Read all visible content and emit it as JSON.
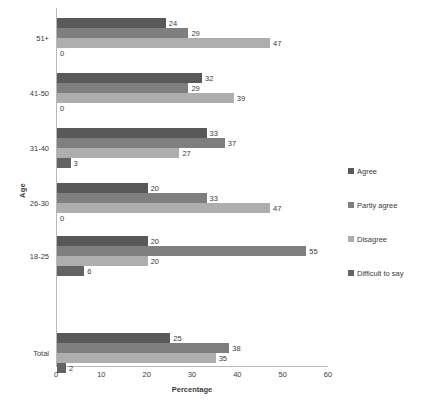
{
  "chart_data": {
    "type": "bar",
    "orientation": "horizontal",
    "title": "",
    "xlabel": "Percentage",
    "ylabel": "Age",
    "xlim": [
      0,
      60
    ],
    "xticks": [
      0,
      10,
      20,
      30,
      40,
      50,
      60
    ],
    "grid": false,
    "legend_position": "right",
    "categories": [
      "Total",
      "18-25",
      "26-30",
      "31-40",
      "41-50",
      "51+"
    ],
    "series": [
      {
        "name": "Agree",
        "color": "#595959",
        "values": [
          25,
          20,
          20,
          33,
          32,
          24
        ]
      },
      {
        "name": "Partly agree",
        "color": "#7f7f7f",
        "values": [
          38,
          55,
          33,
          37,
          29,
          29
        ]
      },
      {
        "name": "Disagree",
        "color": "#aeaeae",
        "values": [
          35,
          20,
          47,
          27,
          39,
          47
        ]
      },
      {
        "name": "Difficult to say",
        "color": "#636363",
        "values": [
          2,
          6,
          0,
          3,
          0,
          0
        ]
      }
    ]
  },
  "axis": {
    "y_title": "Age",
    "x_title": "Percentage",
    "x_tick_labels": [
      "0",
      "10",
      "20",
      "30",
      "40",
      "50",
      "60"
    ],
    "category_labels": [
      "51+",
      "41-50",
      "31-40",
      "26-30",
      "18-25",
      "Total"
    ]
  },
  "legend": {
    "items": [
      {
        "label": "Agree",
        "color": "#595959"
      },
      {
        "label": "Partly agree",
        "color": "#7f7f7f"
      },
      {
        "label": "Disagree",
        "color": "#aeaeae"
      },
      {
        "label": "Difficult to say",
        "color": "#636363"
      }
    ]
  },
  "groups": [
    {
      "label": "51+",
      "bars": [
        {
          "series": "Agree",
          "value": 24,
          "value_label": "24"
        },
        {
          "series": "Partly agree",
          "value": 29,
          "value_label": "29"
        },
        {
          "series": "Disagree",
          "value": 47,
          "value_label": "47"
        },
        {
          "series": "Difficult to say",
          "value": 0,
          "value_label": "0"
        }
      ]
    },
    {
      "label": "41-50",
      "bars": [
        {
          "series": "Agree",
          "value": 32,
          "value_label": "32"
        },
        {
          "series": "Partly agree",
          "value": 29,
          "value_label": "29"
        },
        {
          "series": "Disagree",
          "value": 39,
          "value_label": "39"
        },
        {
          "series": "Difficult to say",
          "value": 0,
          "value_label": "0"
        }
      ]
    },
    {
      "label": "31-40",
      "bars": [
        {
          "series": "Agree",
          "value": 33,
          "value_label": "33"
        },
        {
          "series": "Partly agree",
          "value": 37,
          "value_label": "37"
        },
        {
          "series": "Disagree",
          "value": 27,
          "value_label": "27"
        },
        {
          "series": "Difficult to say",
          "value": 3,
          "value_label": "3"
        }
      ]
    },
    {
      "label": "26-30",
      "bars": [
        {
          "series": "Agree",
          "value": 20,
          "value_label": "20"
        },
        {
          "series": "Partly agree",
          "value": 33,
          "value_label": "33"
        },
        {
          "series": "Disagree",
          "value": 47,
          "value_label": "47"
        },
        {
          "series": "Difficult to say",
          "value": 0,
          "value_label": "0"
        }
      ]
    },
    {
      "label": "18-25",
      "bars": [
        {
          "series": "Agree",
          "value": 20,
          "value_label": "20"
        },
        {
          "series": "Partly agree",
          "value": 55,
          "value_label": "55"
        },
        {
          "series": "Disagree",
          "value": 20,
          "value_label": "20"
        },
        {
          "series": "Difficult to say",
          "value": 6,
          "value_label": "6"
        }
      ]
    },
    {
      "label": "Total",
      "bars": [
        {
          "series": "Agree",
          "value": 25,
          "value_label": "25"
        },
        {
          "series": "Partly agree",
          "value": 38,
          "value_label": "38"
        },
        {
          "series": "Disagree",
          "value": 35,
          "value_label": "35"
        },
        {
          "series": "Difficult to say",
          "value": 2,
          "value_label": "2"
        }
      ]
    }
  ],
  "layout": {
    "group_tops": [
      10,
      65,
      120,
      175,
      228,
      325
    ],
    "bar_height": 10,
    "bar_gap": 0
  }
}
